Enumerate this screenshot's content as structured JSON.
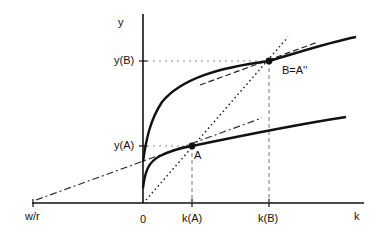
{
  "diagram": {
    "axes": {
      "y_label": "y",
      "x_label": "k",
      "origin_label": "0"
    },
    "y_ticks": [
      {
        "label": "y(B)"
      },
      {
        "label": "y(A)"
      }
    ],
    "x_ticks": [
      {
        "label": "w/r"
      },
      {
        "label": "0"
      },
      {
        "label": "k(A)"
      },
      {
        "label": "k(B)"
      }
    ],
    "points": [
      {
        "name": "A",
        "label": "A"
      },
      {
        "name": "B",
        "label": "B=A''"
      }
    ],
    "curves": [
      {
        "name": "upper-production-function",
        "style": "solid-thick"
      },
      {
        "name": "lower-production-function",
        "style": "solid-thick"
      },
      {
        "name": "iso-cost-ray-from-w-over-r",
        "style": "dash-dot"
      },
      {
        "name": "ray-from-origin",
        "style": "dotted"
      },
      {
        "name": "tangent-at-B",
        "style": "dashed"
      }
    ],
    "colors": {
      "ink": "#111111",
      "guide": "#777777",
      "background": "#ffffff"
    }
  }
}
